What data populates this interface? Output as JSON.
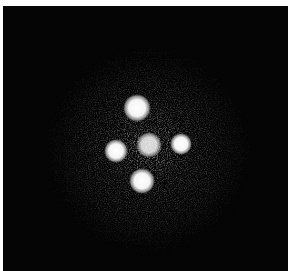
{
  "image": {
    "description": "Astronomical image of a quadruply lensed quasar (cross pattern) with a central galaxy, on a dark noisy background",
    "background_color": "#050505",
    "border_color": "#ffffff",
    "halo": {
      "cx": 145,
      "cy": 144,
      "r": 112,
      "color": "#5a5a5a"
    },
    "spots": [
      {
        "name": "image-a-top",
        "cx": 134,
        "cy": 102,
        "r": 10
      },
      {
        "name": "image-b-left",
        "cx": 113,
        "cy": 145,
        "r": 9
      },
      {
        "name": "central-galaxy",
        "cx": 146,
        "cy": 139,
        "r": 10
      },
      {
        "name": "image-c-right",
        "cx": 178,
        "cy": 138,
        "r": 8
      },
      {
        "name": "image-d-bottom",
        "cx": 139,
        "cy": 175,
        "r": 9
      }
    ]
  }
}
